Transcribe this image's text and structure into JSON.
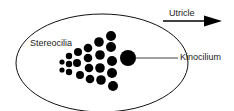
{
  "diagram": {
    "labels": {
      "stereocilia": "Stereocilia",
      "kinocilium": "Kinocilium",
      "utricle": "Utricle"
    },
    "colors": {
      "stroke": "#111111",
      "fill": "#000000",
      "text": "#222222",
      "background": "#ffffff"
    },
    "arrow_direction": "right"
  }
}
